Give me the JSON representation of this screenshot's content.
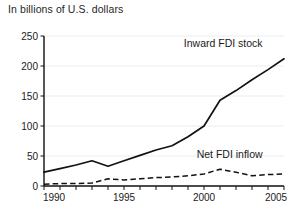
{
  "chart_data": {
    "type": "line",
    "title": "In billions of U.S. dollars",
    "xlabel": "",
    "ylabel": "",
    "xlim": [
      1990,
      2005
    ],
    "ylim": [
      0,
      250
    ],
    "yticks": [
      0,
      50,
      100,
      150,
      200,
      250
    ],
    "xticks": [
      1990,
      1991,
      1992,
      1993,
      1994,
      1995,
      1996,
      1997,
      1998,
      1999,
      2000,
      2001,
      2002,
      2003,
      2004,
      2005
    ],
    "xtick_labels_shown": [
      "1990",
      "1995",
      "2000",
      "2005"
    ],
    "grid": true,
    "legend_position": "inline-annotation",
    "x": [
      1990,
      1991,
      1992,
      1993,
      1994,
      1995,
      1996,
      1997,
      1998,
      1999,
      2000,
      2001,
      2002,
      2003,
      2004,
      2005
    ],
    "series": [
      {
        "name": "Inward FDI stock",
        "style": "solid",
        "color": "#111111",
        "values": [
          23,
          29,
          35,
          42,
          33,
          42,
          51,
          60,
          67,
          82,
          100,
          143,
          159,
          177,
          194,
          212
        ]
      },
      {
        "name": "Net FDI inflow",
        "style": "dashed",
        "color": "#111111",
        "values": [
          3,
          4,
          4,
          5,
          12,
          10,
          12,
          14,
          15,
          17,
          20,
          28,
          23,
          17,
          19,
          20
        ]
      }
    ],
    "annotations": [
      {
        "text": "Inward FDI stock",
        "x": 2001.2,
        "y": 232
      },
      {
        "text": "Net FDI inflow",
        "x": 2001.6,
        "y": 47
      }
    ]
  },
  "axis": {
    "ytick_labels": [
      "0",
      "50",
      "100",
      "150",
      "200",
      "250"
    ],
    "xtick_labels": [
      "1990",
      "1995",
      "2000",
      "2005"
    ]
  },
  "labels": {
    "series_1": "Inward FDI stock",
    "series_2": "Net FDI inflow"
  }
}
